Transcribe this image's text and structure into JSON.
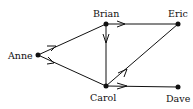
{
  "diagram": {
    "type": "directed-graph",
    "nodes": [
      {
        "id": "anne",
        "label": "Anne",
        "x": 38,
        "y": 55
      },
      {
        "id": "brian",
        "label": "Brian",
        "x": 106,
        "y": 24
      },
      {
        "id": "eric",
        "label": "Eric",
        "x": 178,
        "y": 24
      },
      {
        "id": "carol",
        "label": "Carol",
        "x": 106,
        "y": 86
      },
      {
        "id": "dave",
        "label": "Dave",
        "x": 178,
        "y": 87
      }
    ],
    "edges": [
      {
        "from": "anne",
        "to": "brian"
      },
      {
        "from": "anne",
        "to": "carol"
      },
      {
        "from": "brian",
        "to": "eric"
      },
      {
        "from": "brian",
        "to": "carol"
      },
      {
        "from": "carol",
        "to": "eric"
      },
      {
        "from": "carol",
        "to": "dave"
      }
    ],
    "colors": {
      "line": "#111111",
      "node": "#111111",
      "background": "#ffffff"
    }
  }
}
